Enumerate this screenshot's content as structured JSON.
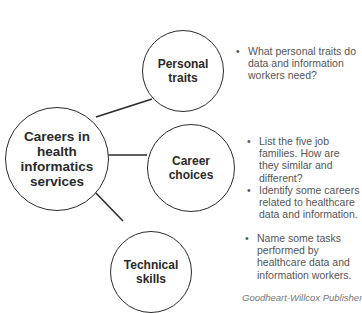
{
  "diagram": {
    "central": {
      "label": "Careers in health informatics services",
      "lines": [
        "Careers in",
        "health",
        "informatics",
        "services"
      ]
    },
    "nodes": [
      {
        "label": "Personal traits",
        "lines": [
          "Personal",
          "traits"
        ],
        "bullets": [
          "What personal traits do data and information workers need?"
        ]
      },
      {
        "label": "Career choices",
        "lines": [
          "Career",
          "choices"
        ],
        "bullets": [
          "List the five job families. How are they similar and different?",
          "Identify some careers related to healthcare data and information."
        ]
      },
      {
        "label": "Technical skills",
        "lines": [
          "Technical",
          "skills"
        ],
        "bullets": [
          "Name some tasks performed by healthcare data and information workers."
        ]
      }
    ]
  },
  "footer": {
    "credit": "Goodheart-Willcox Publisher"
  },
  "colors": {
    "stroke": "#2a2a2a",
    "bullet_text": "#555555",
    "credit_text": "#777777"
  }
}
